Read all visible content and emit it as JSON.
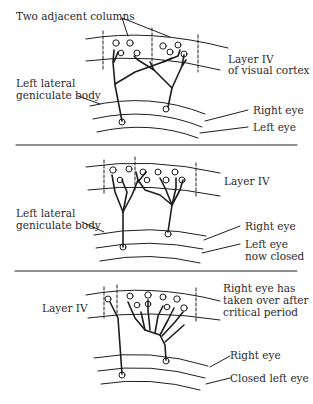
{
  "diagram": {
    "type": "neuroscience-ocular-dominance",
    "panels": [
      {
        "id": "normal",
        "labels": {
          "columns": "Two adjacent columns",
          "layer": "Layer IV",
          "layer_line2": "of visual cortex",
          "lgn_line1": "Left lateral",
          "lgn_line2": "geniculate body",
          "right_eye": "Right eye",
          "left_eye": "Left eye"
        }
      },
      {
        "id": "left-eye-closed",
        "labels": {
          "layer": "Layer IV",
          "lgn_line1": "Left lateral",
          "lgn_line2": "geniculate body",
          "right_eye": "Right eye",
          "left_eye_line1": "Left eye",
          "left_eye_line2": "now closed"
        }
      },
      {
        "id": "after-critical-period",
        "labels": {
          "layer": "Layer IV",
          "note_line1": "Right eye has",
          "note_line2": "taken over  after",
          "note_line3": "critical period",
          "right_eye": "Right eye",
          "left_eye": "Closed left eye"
        }
      }
    ],
    "colors": {
      "ink": "#1e1e1e",
      "background": "#ffffff",
      "text": "#2a2a2a"
    }
  }
}
